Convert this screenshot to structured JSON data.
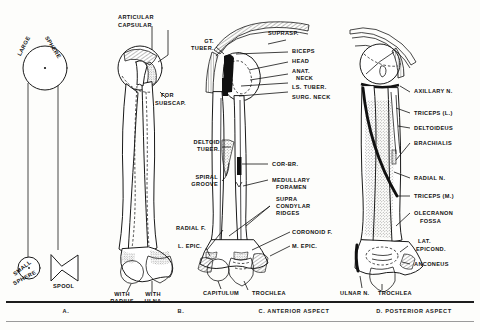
{
  "figure": {
    "ink_color": "#111111",
    "background_color": "#fdfdfb"
  },
  "captions": [
    {
      "id": "A",
      "text": "A."
    },
    {
      "id": "B",
      "text": "B."
    },
    {
      "id": "C",
      "text": "C. ANTERIOR ASPECT"
    },
    {
      "id": "D",
      "text": "D. POSTERIOR ASPECT"
    }
  ],
  "panel_a": {
    "name": "schematic-shapes",
    "labels": {
      "large_sphere_1": "LARGE",
      "large_sphere_2": "SPHERE",
      "small_sphere_1": "SMALL",
      "small_sphere_2": "SPHERE",
      "spool": "SPOOL"
    }
  },
  "panel_b": {
    "name": "attachment-outline",
    "labels": {
      "articular": "ARTICULAR",
      "capsular": "CAPSULAR",
      "for_subscap_1": "FOR",
      "for_subscap_2": "SUBSCAP.",
      "with_radius_1": "WITH",
      "with_radius_2": "RADIUS",
      "with_ulna_1": "WITH",
      "with_ulna_2": "ULNA"
    }
  },
  "panel_c": {
    "name": "anterior-aspect",
    "labels_left": [
      {
        "line1": "GT.",
        "line2": "TUBER."
      },
      {
        "line1": "DELTOID",
        "line2": "TUBER."
      },
      {
        "line1": "SPIRAL",
        "line2": "GROOVE"
      },
      {
        "line1": "RADIAL F.",
        "line2": ""
      },
      {
        "line1": "L. EPIC.",
        "line2": ""
      }
    ],
    "labels_right": [
      {
        "line1": "SUPRASP.",
        "line2": ""
      },
      {
        "line1": "BICEPS",
        "line2": ""
      },
      {
        "line1": "HEAD",
        "line2": ""
      },
      {
        "line1": "ANAT.",
        "line2": "NECK"
      },
      {
        "line1": "LS. TUBER.",
        "line2": ""
      },
      {
        "line1": "SURG. NECK",
        "line2": ""
      },
      {
        "line1": "COR-BR.",
        "line2": ""
      },
      {
        "line1": "MEDULLARY",
        "line2": "FORAMEN"
      },
      {
        "line1": "SUPRA",
        "line2": "CONDYLAR",
        "line3": "RIDGES"
      },
      {
        "line1": "CORONOID F.",
        "line2": ""
      },
      {
        "line1": "M. EPIC.",
        "line2": ""
      }
    ],
    "labels_bottom": [
      {
        "text": "CAPITULUM"
      },
      {
        "text": "TROCHLEA"
      }
    ]
  },
  "panel_d": {
    "name": "posterior-aspect",
    "labels_right": [
      {
        "line1": "AXILLARY N.",
        "line2": ""
      },
      {
        "line1": "TRICEPS (L.)",
        "line2": ""
      },
      {
        "line1": "DELTOIDEUS",
        "line2": ""
      },
      {
        "line1": "BRACHIALIS",
        "line2": ""
      },
      {
        "line1": "RADIAL N.",
        "line2": ""
      },
      {
        "line1": "TRICEPS (M.)",
        "line2": ""
      },
      {
        "line1": "OLECRANON",
        "line2": "FOSSA"
      },
      {
        "line1": "LAT.",
        "line2": "EPICOND."
      },
      {
        "line1": "ANCONEUS",
        "line2": ""
      }
    ],
    "labels_bottom": [
      {
        "text": "ULNAR N."
      },
      {
        "text": "TROCHLEA"
      }
    ]
  }
}
